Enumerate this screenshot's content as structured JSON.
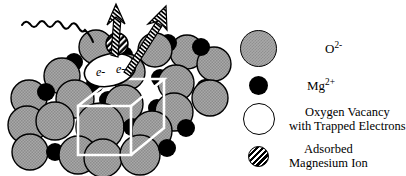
{
  "figure": {
    "kind": "crystal-structure-schematic",
    "background_color": "#ffffff"
  },
  "crystal": {
    "unit_cell_label": "unit cell wireframe",
    "unit_cell_color": "#ffffff",
    "oxygen_color": "#a8a8a8",
    "magnesium_color": "#000000",
    "vacancy_color": "#ffffff",
    "outline_color": "#000000",
    "vacancy_electrons": {
      "first": "e-",
      "second": "e-"
    },
    "annotations": {
      "photon_in": "incident photon wavy arrow",
      "emission_left": "hatched emission arrow up",
      "emission_right": "hatched emission arrow up-right"
    }
  },
  "legend": {
    "entries": [
      {
        "symbol": "dithered-gray-sphere-icon",
        "label_main": "O",
        "label_sup": "2-",
        "label_second": ""
      },
      {
        "symbol": "black-sphere-icon",
        "label_main": "Mg",
        "label_sup": "2+",
        "label_second": ""
      },
      {
        "symbol": "open-circle-icon",
        "label_main": "Oxygen Vacancy",
        "label_sup": "",
        "label_second": "with Trapped Electrons"
      },
      {
        "symbol": "hatched-circle-icon",
        "label_main": "Adsorbed",
        "label_sup": "",
        "label_second": "Magnesium Ion"
      }
    ]
  }
}
